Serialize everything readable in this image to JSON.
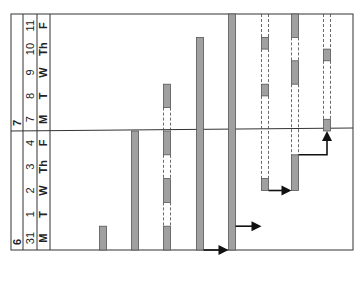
{
  "chart_data": {
    "type": "gantt",
    "orientation": "rotated-90-ccw",
    "colors": {
      "bar": "#a0a0a0",
      "bar_stroke": "#555555",
      "line": "#333333",
      "arrow": "#111111"
    },
    "months": [
      {
        "label": "6",
        "start_day_index": 0
      },
      {
        "label": "7",
        "start_day_index": 5
      }
    ],
    "days": [
      {
        "date": "31",
        "weekday": "M"
      },
      {
        "date": "1",
        "weekday": "T"
      },
      {
        "date": "2",
        "weekday": "W"
      },
      {
        "date": "3",
        "weekday": "Th"
      },
      {
        "date": "4",
        "weekday": "F"
      },
      {
        "date": "7",
        "weekday": "M"
      },
      {
        "date": "8",
        "weekday": "T"
      },
      {
        "date": "9",
        "weekday": "W"
      },
      {
        "date": "10",
        "weekday": "Th"
      },
      {
        "date": "11",
        "weekday": "F"
      }
    ],
    "tasks": [
      {
        "row": 1,
        "segments": [
          {
            "start": 0.0,
            "end": 1.0,
            "type": "solid"
          }
        ]
      },
      {
        "row": 2,
        "segments": [
          {
            "start": 0.0,
            "end": 5.0,
            "type": "solid"
          }
        ]
      },
      {
        "row": 3,
        "segments": [
          {
            "start": 0.0,
            "end": 1.0,
            "type": "solid"
          },
          {
            "start": 1.0,
            "end": 2.0,
            "type": "dashed"
          },
          {
            "start": 2.0,
            "end": 3.0,
            "type": "solid"
          },
          {
            "start": 3.0,
            "end": 4.0,
            "type": "dashed"
          },
          {
            "start": 4.0,
            "end": 5.0,
            "type": "solid"
          },
          {
            "start": 5.0,
            "end": 6.0,
            "type": "dashed"
          },
          {
            "start": 6.0,
            "end": 7.0,
            "type": "solid"
          }
        ]
      },
      {
        "row": 4,
        "segments": [
          {
            "start": 0.0,
            "end": 9.0,
            "type": "solid"
          }
        ]
      },
      {
        "row": 5,
        "segments": [
          {
            "start": 0.0,
            "end": 10.0,
            "type": "solid"
          }
        ]
      },
      {
        "row": 6,
        "segments": [
          {
            "start": 2.5,
            "end": 3.0,
            "type": "solid"
          },
          {
            "start": 3.0,
            "end": 6.5,
            "type": "dashed"
          },
          {
            "start": 6.5,
            "end": 7.0,
            "type": "solid"
          },
          {
            "start": 7.0,
            "end": 8.5,
            "type": "dashed"
          },
          {
            "start": 8.5,
            "end": 9.0,
            "type": "solid"
          },
          {
            "start": 9.0,
            "end": 10.0,
            "type": "dashed"
          }
        ]
      },
      {
        "row": 7,
        "segments": [
          {
            "start": 2.5,
            "end": 4.0,
            "type": "solid"
          },
          {
            "start": 4.0,
            "end": 7.0,
            "type": "dashed"
          },
          {
            "start": 7.0,
            "end": 8.0,
            "type": "solid"
          },
          {
            "start": 8.0,
            "end": 9.0,
            "type": "dashed"
          },
          {
            "start": 9.0,
            "end": 10.0,
            "type": "solid"
          }
        ]
      },
      {
        "row": 8,
        "segments": [
          {
            "start": 5.0,
            "end": 5.5,
            "type": "solid"
          },
          {
            "start": 5.5,
            "end": 8.0,
            "type": "dashed"
          },
          {
            "start": 8.0,
            "end": 8.5,
            "type": "solid"
          },
          {
            "start": 8.5,
            "end": 10.0,
            "type": "dashed"
          }
        ]
      }
    ],
    "dependencies": [
      {
        "from_row": 4,
        "to_row": 5,
        "at": 0.0
      },
      {
        "from_row": 5,
        "to_row": 6,
        "at": 1.0
      },
      {
        "from_row": 6,
        "to_row": 7,
        "at": 2.5
      },
      {
        "from_row": 7,
        "to_row": 8,
        "at": 4.0
      }
    ],
    "title": "",
    "xlabel": "",
    "ylabel": ""
  }
}
